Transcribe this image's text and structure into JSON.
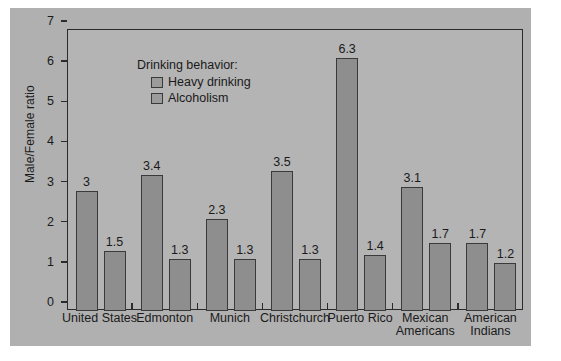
{
  "chart_data": {
    "type": "bar",
    "title": "",
    "xlabel": "",
    "ylabel": "Male/Female ratio",
    "ylim": [
      0,
      7
    ],
    "yticks": [
      0,
      1,
      2,
      3,
      4,
      5,
      6,
      7
    ],
    "grid": false,
    "legend_position": "top-left",
    "legend_title": "Drinking behavior:",
    "categories": [
      "United States",
      "Edmonton",
      "Munich",
      "Christchurch",
      "Puerto Rico",
      "Mexican Americans",
      "American Indians"
    ],
    "series": [
      {
        "name": "Heavy drinking",
        "values": [
          3,
          3.4,
          2.3,
          3.5,
          6.3,
          3.1,
          1.7
        ],
        "labels": [
          "3",
          "3.4",
          "2.3",
          "3.5",
          "6.3",
          "3.1",
          "1.7"
        ],
        "color": "#8e8e8e"
      },
      {
        "name": "Alcoholism",
        "values": [
          1.5,
          1.3,
          1.3,
          1.3,
          1.4,
          1.7,
          1.2
        ],
        "labels": [
          "1.5",
          "1.3",
          "1.3",
          "1.3",
          "1.4",
          "1.7",
          "1.2"
        ],
        "color": "#8e8e8e"
      }
    ]
  },
  "axis": {
    "y_title": "Male/Female ratio",
    "y_tick_labels": [
      "0",
      "1",
      "2",
      "3",
      "4",
      "5",
      "6",
      "7"
    ]
  },
  "legend": {
    "title": "Drinking behavior:",
    "items": [
      {
        "label": "Heavy drinking",
        "swatch": "heavy-drinking-swatch"
      },
      {
        "label": "Alcoholism",
        "swatch": "alcoholism-swatch"
      }
    ]
  },
  "colors": {
    "panel_background": "#b0b0b0",
    "plot_background": "#b4b4b4",
    "bar_fill": "#8e8e8e",
    "bar_border": "#3a3a3a",
    "axis": "#2b2b2b",
    "text": "#1a1a1a"
  }
}
